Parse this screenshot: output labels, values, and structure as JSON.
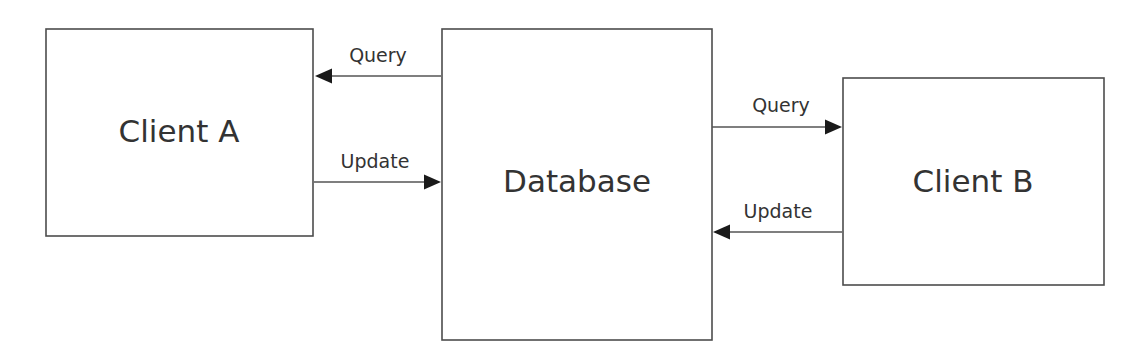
{
  "diagram": {
    "background_color": "#ffffff",
    "box_stroke_color": "#4d4d4d",
    "box_fill_color": "#ffffff",
    "text_color": "#333333",
    "edge_color": "#555555",
    "arrowhead_color": "#1a1a1a",
    "nodes": [
      {
        "id": "client-a",
        "label": "Client A",
        "x": 46,
        "y": 29,
        "width": 267,
        "height": 207,
        "label_x": 179,
        "label_y": 133
      },
      {
        "id": "database",
        "label": "Database",
        "x": 442,
        "y": 29,
        "width": 270,
        "height": 311,
        "label_x": 577,
        "label_y": 183
      },
      {
        "id": "client-b",
        "label": "Client B",
        "x": 843,
        "y": 78,
        "width": 261,
        "height": 207,
        "label_x": 973,
        "label_y": 183
      }
    ],
    "edges": [
      {
        "id": "query-db-to-client-a",
        "label": "Query",
        "source": "database",
        "target": "client-a",
        "direction": "left",
        "x1": 441,
        "x2": 315,
        "y": 76,
        "label_x": 378,
        "label_y": 62
      },
      {
        "id": "update-client-a-to-db",
        "label": "Update",
        "source": "client-a",
        "target": "database",
        "direction": "right",
        "x1": 314,
        "x2": 441,
        "y": 182,
        "label_x": 375,
        "label_y": 168
      },
      {
        "id": "query-db-to-client-b",
        "label": "Query",
        "source": "database",
        "target": "client-b",
        "direction": "right",
        "x1": 712,
        "x2": 842,
        "y": 127,
        "label_x": 781,
        "label_y": 112
      },
      {
        "id": "update-client-b-to-db",
        "label": "Update",
        "source": "client-b",
        "target": "database",
        "direction": "left",
        "x1": 842,
        "x2": 713,
        "y": 232,
        "label_x": 778,
        "label_y": 218
      }
    ]
  }
}
